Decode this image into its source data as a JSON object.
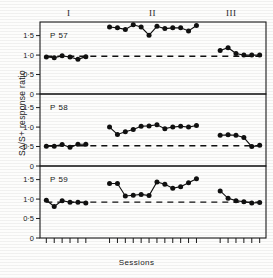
{
  "figure": {
    "ylabel": "S∆/S+ response ratio",
    "xlabel": "Sessions",
    "phases": [
      {
        "label": "I"
      },
      {
        "label": "II"
      },
      {
        "label": "III"
      }
    ],
    "ytick_labels": [
      "1·5",
      "1·0",
      "0·5",
      "0"
    ],
    "panel_labels": [
      "P 57",
      "P 58",
      "P 59"
    ],
    "marker_color": "#101010",
    "line_color": "#101010",
    "axis_color": "#1a1a1a"
  },
  "chart_data": {
    "type": "line",
    "title": "",
    "xlabel": "Sessions",
    "ylabel": "S∆/S+ response ratio",
    "ylim": [
      0,
      1.85
    ],
    "yticks": [
      0,
      0.5,
      1.0,
      1.5
    ],
    "ytick_labels": [
      "0",
      "0·5",
      "1·0",
      "1·5"
    ],
    "grid": false,
    "legend": "none",
    "phase_labels": [
      "I",
      "II",
      "III"
    ],
    "panels": [
      {
        "name": "P 57",
        "baseline": 0.97,
        "segments": [
          {
            "phase": "I",
            "x": [
              1,
              2,
              3,
              4,
              5,
              6
            ],
            "y": [
              0.95,
              0.93,
              0.98,
              0.95,
              0.89,
              0.96
            ]
          },
          {
            "phase": "II",
            "x": [
              9,
              10,
              11,
              12,
              13,
              14,
              15,
              16,
              17,
              18,
              19,
              20
            ],
            "y": [
              1.72,
              1.7,
              1.66,
              1.78,
              1.72,
              1.51,
              1.74,
              1.68,
              1.7,
              1.7,
              1.62,
              1.76
            ]
          },
          {
            "phase": "III",
            "x": [
              23,
              24,
              25,
              26,
              27,
              28
            ],
            "y": [
              1.12,
              1.19,
              1.04,
              1.0,
              1.0,
              1.0
            ]
          }
        ]
      },
      {
        "name": "P 58",
        "baseline": 0.52,
        "segments": [
          {
            "phase": "I",
            "x": [
              1,
              2,
              3,
              4,
              5,
              6
            ],
            "y": [
              0.51,
              0.51,
              0.55,
              0.48,
              0.56,
              0.56
            ]
          },
          {
            "phase": "II",
            "x": [
              9,
              10,
              11,
              12,
              13,
              14,
              15,
              16,
              17,
              18,
              19,
              20
            ],
            "y": [
              1.0,
              0.81,
              0.88,
              0.94,
              1.02,
              1.03,
              1.06,
              0.96,
              1.0,
              1.02,
              1.0,
              1.04
            ]
          },
          {
            "phase": "III",
            "x": [
              23,
              24,
              25,
              26,
              27,
              28
            ],
            "y": [
              0.79,
              0.8,
              0.79,
              0.73,
              0.5,
              0.53
            ]
          }
        ]
      },
      {
        "name": "P 59",
        "baseline": 0.92,
        "segments": [
          {
            "phase": "I",
            "x": [
              1,
              2,
              3,
              4,
              5,
              6
            ],
            "y": [
              0.97,
              0.81,
              0.96,
              0.92,
              0.92,
              0.9
            ]
          },
          {
            "phase": "II",
            "x": [
              9,
              10,
              11,
              12,
              13,
              14,
              15,
              16,
              17,
              18,
              19,
              20
            ],
            "y": [
              1.4,
              1.4,
              1.08,
              1.1,
              1.12,
              1.09,
              1.44,
              1.38,
              1.28,
              1.32,
              1.42,
              1.52
            ]
          },
          {
            "phase": "III",
            "x": [
              23,
              24,
              25,
              26,
              27,
              28
            ],
            "y": [
              1.21,
              1.02,
              0.96,
              0.93,
              0.9,
              0.91
            ]
          }
        ]
      }
    ]
  }
}
